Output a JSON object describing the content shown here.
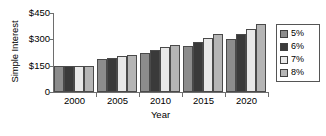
{
  "chart_data": {
    "type": "bar",
    "title": "",
    "xlabel": "Year",
    "ylabel": "Simple Interest",
    "categories": [
      "2000",
      "2005",
      "2010",
      "2015",
      "2020"
    ],
    "series": [
      {
        "name": "5%",
        "color": "#8c8c8c",
        "values": [
          150,
          188,
          225,
          263,
          300
        ]
      },
      {
        "name": "6%",
        "color": "#3a3a3a",
        "values": [
          150,
          195,
          240,
          285,
          330
        ]
      },
      {
        "name": "7%",
        "color": "#e8e8e8",
        "values": [
          150,
          203,
          255,
          308,
          360
        ]
      },
      {
        "name": "8%",
        "color": "#b5b5b5",
        "values": [
          150,
          210,
          270,
          330,
          390
        ]
      }
    ],
    "ylim": [
      0,
      450
    ],
    "yticks": [
      0,
      150,
      300,
      450
    ],
    "ytick_labels": [
      "0",
      "$150",
      "$300",
      "$450"
    ],
    "grid": false,
    "legend_position": "right",
    "legend_entries": [
      "5%",
      "6%",
      "7%",
      "8%"
    ]
  },
  "axis": {
    "y_title": "Simple Interest",
    "x_title": "Year"
  }
}
